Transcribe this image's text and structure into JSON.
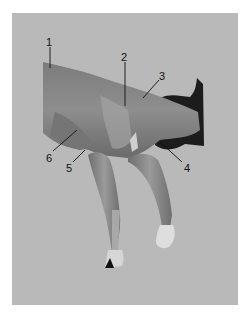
{
  "figure": {
    "background_color": "#b9b9b9",
    "labels": [
      {
        "id": "1",
        "text": "1"
      },
      {
        "id": "2",
        "text": "2"
      },
      {
        "id": "3",
        "text": "3"
      },
      {
        "id": "4",
        "text": "4"
      },
      {
        "id": "5",
        "text": "5"
      },
      {
        "id": "6",
        "text": "6"
      }
    ]
  }
}
